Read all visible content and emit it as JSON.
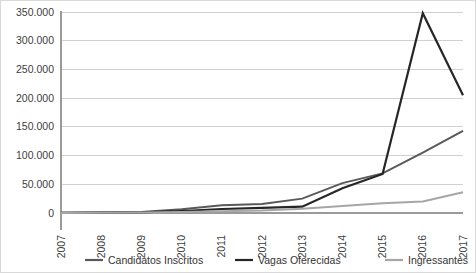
{
  "chart_data": {
    "type": "line",
    "title": "",
    "xlabel": "",
    "ylabel": "",
    "categories": [
      "2007",
      "2008",
      "2009",
      "2010",
      "2011",
      "2012",
      "2013",
      "2014",
      "2015",
      "2016",
      "2017"
    ],
    "ylim": [
      0,
      350000
    ],
    "ytick_values": [
      0,
      50000,
      100000,
      150000,
      200000,
      250000,
      300000,
      350000
    ],
    "ytick_labels": [
      "0",
      "50.000",
      "100.000",
      "150.000",
      "200.000",
      "250.000",
      "300.000",
      "350.000"
    ],
    "grid": true,
    "legend_position": "bottom",
    "number_format": "pt-BR",
    "series": [
      {
        "name": "Candidatos Inscritos",
        "color": "#595959",
        "width": 2.0,
        "values": [
          600,
          900,
          1800,
          6500,
          13500,
          15500,
          25000,
          52000,
          69000,
          105000,
          143000
        ]
      },
      {
        "name": "Vagas Oferecidas",
        "color": "#262626",
        "width": 2.2,
        "values": [
          400,
          700,
          1200,
          3500,
          7000,
          9000,
          11000,
          43000,
          68000,
          348000,
          205000
        ]
      },
      {
        "name": "Ingressantes",
        "color": "#a6a6a6",
        "width": 2.0,
        "values": [
          200,
          350,
          700,
          1800,
          3200,
          4200,
          7500,
          12000,
          17000,
          20000,
          36000
        ]
      }
    ]
  },
  "legend": {
    "items": [
      {
        "label": "Candidatos Inscritos",
        "color": "#595959"
      },
      {
        "label": "Vagas Oferecidas",
        "color": "#262626"
      },
      {
        "label": "Ingressantes",
        "color": "#a6a6a6"
      }
    ]
  },
  "axes": {
    "y_axis_name": "value-axis",
    "x_axis_name": "category-axis"
  }
}
